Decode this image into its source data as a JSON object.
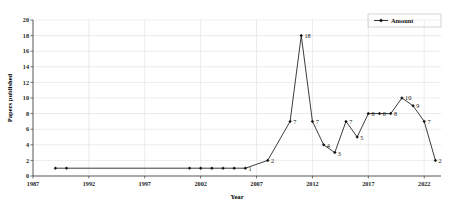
{
  "chart_data": {
    "type": "line",
    "title": "",
    "xlabel": "Year",
    "ylabel": "Papers published",
    "xlim": [
      1987,
      2023.5
    ],
    "ylim": [
      0,
      20
    ],
    "grid": true,
    "legend_position": "top-right",
    "legend": [
      "Amount"
    ],
    "x_ticks": [
      "1987",
      "1992",
      "1997",
      "2002",
      "2007",
      "2012",
      "2017",
      "2022"
    ],
    "x_tick_values": [
      1987,
      1992,
      1997,
      2002,
      2007,
      2012,
      2017,
      2022
    ],
    "y_ticks": [
      "0",
      "2",
      "4",
      "6",
      "8",
      "10",
      "12",
      "14",
      "16",
      "18",
      "20"
    ],
    "y_tick_values": [
      0,
      2,
      4,
      6,
      8,
      10,
      12,
      14,
      16,
      18,
      20
    ],
    "series": [
      {
        "name": "Amount",
        "marker": "diamond",
        "color": "#111111",
        "x": [
          1989,
          1990,
          2001,
          2002,
          2003,
          2004,
          2005,
          2006,
          2008,
          2010,
          2011,
          2012,
          2013,
          2014,
          2015,
          2016,
          2017,
          2018,
          2019,
          2020,
          2021,
          2022,
          2023
        ],
        "values": [
          1,
          1,
          1,
          1,
          1,
          1,
          1,
          1,
          2,
          7,
          18,
          7,
          4,
          3,
          7,
          5,
          8,
          8,
          8,
          10,
          9,
          7,
          2
        ],
        "point_labels": [
          "",
          "",
          "",
          "",
          "",
          "",
          "",
          "1",
          "2",
          "7",
          "18",
          "7",
          "4",
          "3",
          "7",
          "5",
          "8",
          "8",
          "8",
          "10",
          "9",
          "7",
          "2"
        ]
      }
    ]
  },
  "legend": {
    "entry_label": "Amount"
  },
  "axes": {
    "x_title": "Year",
    "y_title": "Papers published"
  }
}
